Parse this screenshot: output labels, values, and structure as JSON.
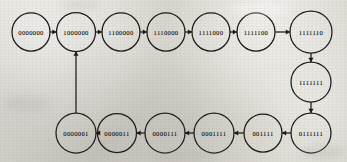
{
  "figure": {
    "kind": "state-transition-diagram",
    "title": "",
    "node_count": 16,
    "background_color": "#dedbd4",
    "ink_color": "#191917"
  },
  "chart_data": {
    "type": "diagram",
    "title": "",
    "xlabel": "",
    "ylabel": "",
    "layout": "two-row-ring",
    "nodes": [
      {
        "id": "n0",
        "label": "0000000",
        "cx": 31,
        "cy": 32,
        "r": 19
      },
      {
        "id": "n1",
        "label": "1000000",
        "cx": 76,
        "cy": 32,
        "r": 19.5
      },
      {
        "id": "n2",
        "label": "1100000",
        "cx": 121,
        "cy": 32,
        "r": 19
      },
      {
        "id": "n3",
        "label": "1110000",
        "cx": 166,
        "cy": 32,
        "r": 19
      },
      {
        "id": "n4",
        "label": "1111000",
        "cx": 211,
        "cy": 32,
        "r": 19
      },
      {
        "id": "n5",
        "label": "1111100",
        "cx": 256,
        "cy": 32,
        "r": 19
      },
      {
        "id": "n6",
        "label": "1111110",
        "cx": 311,
        "cy": 32,
        "r": 21
      },
      {
        "id": "n7",
        "label": "1111111",
        "cx": 311,
        "cy": 82,
        "r": 20
      },
      {
        "id": "n8",
        "label": "0111111",
        "cx": 311,
        "cy": 133,
        "r": 20
      },
      {
        "id": "n9",
        "label": "001111",
        "cx": 263,
        "cy": 133,
        "r": 19
      },
      {
        "id": "n10",
        "label": "0001111",
        "cx": 214,
        "cy": 133,
        "r": 20
      },
      {
        "id": "n11",
        "label": "0000111",
        "cx": 165,
        "cy": 133,
        "r": 20
      },
      {
        "id": "n12",
        "label": "0000011",
        "cx": 117,
        "cy": 133,
        "r": 19.5
      },
      {
        "id": "n13",
        "label": "0000001",
        "cx": 76,
        "cy": 133,
        "r": 20
      }
    ],
    "edges": [
      {
        "from": "n0",
        "to": "n1",
        "direction": "right"
      },
      {
        "from": "n1",
        "to": "n2",
        "direction": "right"
      },
      {
        "from": "n2",
        "to": "n3",
        "direction": "right"
      },
      {
        "from": "n3",
        "to": "n4",
        "direction": "right"
      },
      {
        "from": "n4",
        "to": "n5",
        "direction": "right"
      },
      {
        "from": "n5",
        "to": "n6",
        "direction": "right"
      },
      {
        "from": "n6",
        "to": "n7",
        "direction": "down"
      },
      {
        "from": "n7",
        "to": "n8",
        "direction": "down"
      },
      {
        "from": "n8",
        "to": "n9",
        "direction": "left"
      },
      {
        "from": "n9",
        "to": "n10",
        "direction": "left"
      },
      {
        "from": "n10",
        "to": "n11",
        "direction": "left"
      },
      {
        "from": "n11",
        "to": "n12",
        "direction": "left"
      },
      {
        "from": "n12",
        "to": "n13",
        "direction": "left"
      },
      {
        "from": "n13",
        "to": "n1",
        "direction": "up"
      }
    ],
    "sequence": [
      "0000000",
      "1000000",
      "1100000",
      "1110000",
      "1111000",
      "1111100",
      "1111110",
      "1111111",
      "0111111",
      "001111",
      "0001111",
      "0000111",
      "0000011",
      "0000001"
    ]
  }
}
